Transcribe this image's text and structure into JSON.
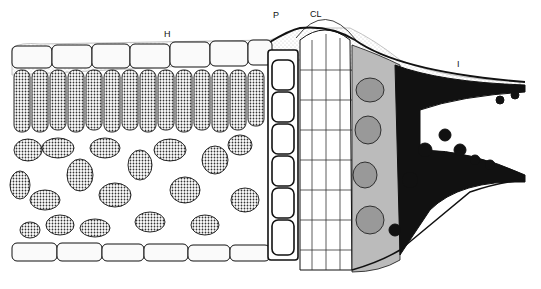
{
  "figure": {
    "labels": {
      "H": "H",
      "P": "P",
      "CL": "CL",
      "I": "I"
    }
  }
}
